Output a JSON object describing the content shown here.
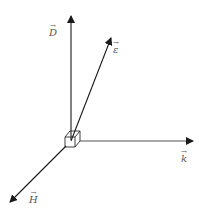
{
  "diagram": {
    "type": "vector-diagram",
    "colors": {
      "line": "#1a1a1a",
      "label": "#555555",
      "background": "#ffffff"
    },
    "origin": {
      "x": 71,
      "y": 140
    },
    "vectors": [
      {
        "id": "D",
        "label": "D",
        "symbol": "→",
        "from": [
          71,
          140
        ],
        "to": [
          71,
          15
        ]
      },
      {
        "id": "epsilon",
        "label": "ε",
        "symbol": "→",
        "from": [
          71,
          140
        ],
        "to": [
          111,
          37
        ]
      },
      {
        "id": "k",
        "label": "k",
        "symbol": "→",
        "from": [
          80,
          141
        ],
        "to": [
          193,
          141
        ]
      },
      {
        "id": "H",
        "label": "H",
        "symbol": "→",
        "from": [
          66,
          146
        ],
        "to": [
          10,
          202
        ]
      }
    ],
    "labels": {
      "D": "D",
      "epsilon": "ε",
      "k": "k",
      "H": "H",
      "arrow": "→"
    }
  }
}
